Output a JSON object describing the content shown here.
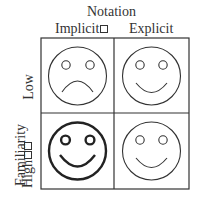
{
  "diagram": {
    "column_axis": {
      "title": "Notation",
      "labels": [
        "Implicit",
        "Explicit"
      ]
    },
    "row_axis": {
      "title": "Familiarity",
      "labels": [
        "Low",
        "High"
      ]
    },
    "cells": [
      {
        "row": "Low",
        "col": "Implicit",
        "face": "sad-face-icon",
        "emphasis": false
      },
      {
        "row": "Low",
        "col": "Explicit",
        "face": "happy-face-icon",
        "emphasis": false
      },
      {
        "row": "High",
        "col": "Implicit",
        "face": "happy-face-icon",
        "emphasis": true
      },
      {
        "row": "High",
        "col": "Explicit",
        "face": "happy-face-icon",
        "emphasis": false
      }
    ]
  }
}
